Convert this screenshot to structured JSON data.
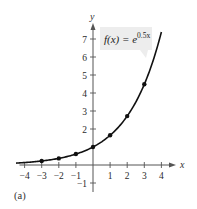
{
  "chart_data": {
    "type": "line",
    "title": "",
    "function_label": {
      "prefix": "f(x) = e",
      "exponent": "0.5x"
    },
    "xlabel": "x",
    "ylabel": "y",
    "xlim": [
      -4.3,
      4.6
    ],
    "ylim": [
      -1.5,
      7.8
    ],
    "x_ticks": [
      -4,
      -3,
      -2,
      -1,
      1,
      2,
      3,
      4
    ],
    "y_ticks": [
      -1,
      2,
      3,
      4,
      5,
      6,
      7
    ],
    "grid": false,
    "series": [
      {
        "name": "f(x) = e^(0.5x)",
        "curve_domain": [
          -4.5,
          4.0
        ],
        "points": [
          {
            "x": -3,
            "y": 0.223
          },
          {
            "x": -2,
            "y": 0.368
          },
          {
            "x": -1,
            "y": 0.607
          },
          {
            "x": 0,
            "y": 1.0
          },
          {
            "x": 1,
            "y": 1.649
          },
          {
            "x": 2,
            "y": 2.718
          },
          {
            "x": 3,
            "y": 4.482
          }
        ]
      }
    ]
  },
  "caption": "(a)",
  "colors": {
    "curve": "#111111",
    "axis": "#555555",
    "label_box": "#ededed"
  }
}
